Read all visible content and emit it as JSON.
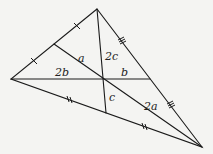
{
  "diagram": {
    "type": "triangle-medians",
    "vertices": {
      "top": [
        97,
        9
      ],
      "left": [
        11,
        79
      ],
      "bottom_right": [
        202,
        147
      ]
    },
    "centroid": [
      103,
      79
    ],
    "midpoints": {
      "left_side": [
        54,
        44
      ],
      "right_side": [
        150,
        79
      ],
      "bottom_side": [
        106,
        113
      ]
    },
    "labels": {
      "a": "a",
      "two_a": "2a",
      "b": "b",
      "two_b": "2b",
      "c": "c",
      "two_c": "2c"
    },
    "tick_marks": {
      "left_side": "single",
      "right_side": "triple",
      "bottom_side": "double"
    },
    "colors": {
      "line": "#1a1a1a",
      "background": "#f4f4f2"
    }
  }
}
